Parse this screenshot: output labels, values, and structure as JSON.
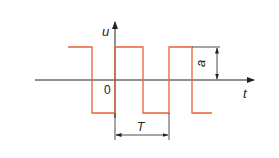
{
  "diagram": {
    "type": "square-wave",
    "colors": {
      "signal": "#e8603a",
      "axis": "#222222"
    },
    "labels": {
      "y_axis": "u",
      "x_axis": "t",
      "origin": "0",
      "period": "T",
      "amplitude": "a"
    }
  }
}
